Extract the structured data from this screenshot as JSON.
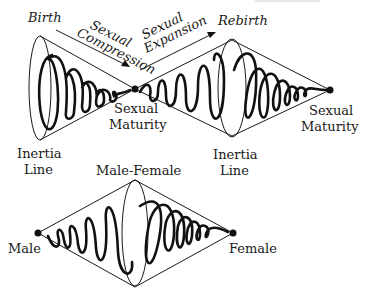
{
  "diagram": {
    "top_row": {
      "labels": {
        "birth": "Birth",
        "sexual_compression": [
          "Sexual",
          "Compression"
        ],
        "sexual_expansion": [
          "Sexual",
          "Expansion"
        ],
        "rebirth": "Rebirth",
        "sexual_maturity_1": [
          "Sexual",
          "Maturity"
        ],
        "sexual_maturity_2": [
          "Sexual",
          "Maturity"
        ],
        "inertia_line_1": [
          "Inertia",
          "Line"
        ],
        "inertia_line_2": [
          "Inertia",
          "Line"
        ]
      }
    },
    "bottom_row": {
      "labels": {
        "male_female": "Male-Female",
        "male": "Male",
        "female": "Female"
      }
    },
    "colors": {
      "ink": "#1a1a1a",
      "background": "#ffffff"
    }
  }
}
